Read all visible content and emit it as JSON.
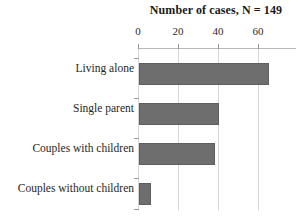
{
  "chart_data": {
    "type": "bar",
    "orientation": "horizontal",
    "title": "Number of cases, N = 149",
    "xlabel": "",
    "ylabel": "",
    "categories": [
      "Living alone",
      "Single parent",
      "Couples with children",
      "Couples without children"
    ],
    "values": [
      65,
      40,
      38,
      6
    ],
    "xlim": [
      0,
      70
    ],
    "xticks": [
      0,
      20,
      40,
      60
    ],
    "xtick_labels": [
      "0",
      "20",
      "40",
      "60"
    ],
    "grid": true,
    "grid_axis": "x",
    "legend": false,
    "axis_position": "top",
    "bar_color": "#6e6e6e",
    "bar_edge_color": "#5e5e5e",
    "gridline_color": "#d6d6d6",
    "axis_color": "#b9b9b9",
    "total_n": 149
  }
}
